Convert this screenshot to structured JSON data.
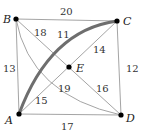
{
  "graph": {
    "nodes": [
      {
        "id": "A",
        "label": "A",
        "x": 19,
        "y": 114
      },
      {
        "id": "B",
        "label": "B",
        "x": 16,
        "y": 19
      },
      {
        "id": "C",
        "label": "C",
        "x": 117,
        "y": 21
      },
      {
        "id": "D",
        "label": "D",
        "x": 121,
        "y": 115
      },
      {
        "id": "E",
        "label": "E",
        "x": 69,
        "y": 67
      }
    ],
    "edges": [
      {
        "from": "B",
        "to": "C",
        "weight": "20",
        "shape": "straight"
      },
      {
        "from": "B",
        "to": "A",
        "weight": "13",
        "shape": "straight"
      },
      {
        "from": "A",
        "to": "D",
        "weight": "17",
        "shape": "straight"
      },
      {
        "from": "C",
        "to": "D",
        "weight": "12",
        "shape": "straight"
      },
      {
        "from": "B",
        "to": "E",
        "weight": "18",
        "shape": "straight"
      },
      {
        "from": "E",
        "to": "D",
        "weight": "16",
        "shape": "straight"
      },
      {
        "from": "A",
        "to": "E",
        "weight": "15",
        "shape": "straight"
      },
      {
        "from": "E",
        "to": "C",
        "weight": "14",
        "shape": "straight"
      },
      {
        "from": "B",
        "to": "D",
        "weight": "19",
        "shape": "curve"
      },
      {
        "from": "A",
        "to": "C",
        "weight": "11",
        "shape": "curve-thick"
      }
    ]
  },
  "labels": {
    "A": "A",
    "B": "B",
    "C": "C",
    "D": "D",
    "E": "E",
    "w_BC": "20",
    "w_BA": "13",
    "w_AD": "17",
    "w_CD": "12",
    "w_BE": "18",
    "w_ED": "16",
    "w_AE": "15",
    "w_EC": "14",
    "w_BD_curve": "19",
    "w_AC_curve": "11"
  }
}
